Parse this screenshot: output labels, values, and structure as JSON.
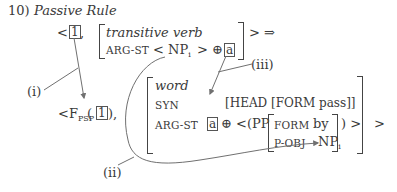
{
  "example": {
    "number": "10)",
    "title": "Passive Rule"
  },
  "input": {
    "open": "<",
    "tag": "1",
    "comma": ",",
    "avm_type": "transitive verb",
    "arg_st_label": "ARG-ST",
    "arg_st_value_open": "< NP",
    "arg_st_subscript": "i",
    "arg_st_value_close": "> ⊕",
    "arg_st_tag": "a",
    "close": "> ⇒"
  },
  "output": {
    "prefix_open": "<F",
    "prefix_subscript": "PSP",
    "paren_open": "(",
    "tag": "1",
    "paren_close": "),",
    "avm_type": "word",
    "syn_label": "SYN",
    "syn_value": "[HEAD [FORM pass]]",
    "arg_st_label": "ARG-ST",
    "arg_st_tag": "a",
    "arg_st_oplus": "⊕ <(PP",
    "pp_form_label": "FORM",
    "pp_form_value": "by",
    "pp_pobj_label": "P-OBJ",
    "pp_pobj_value": "NP",
    "pp_pobj_subscript": "i",
    "pp_close": ") >",
    "close": ">"
  },
  "annotations": {
    "i": "(i)",
    "ii": "(ii)",
    "iii": "(iii)"
  },
  "colors": {
    "text": "#3a3a3a",
    "lines": "#707070"
  }
}
